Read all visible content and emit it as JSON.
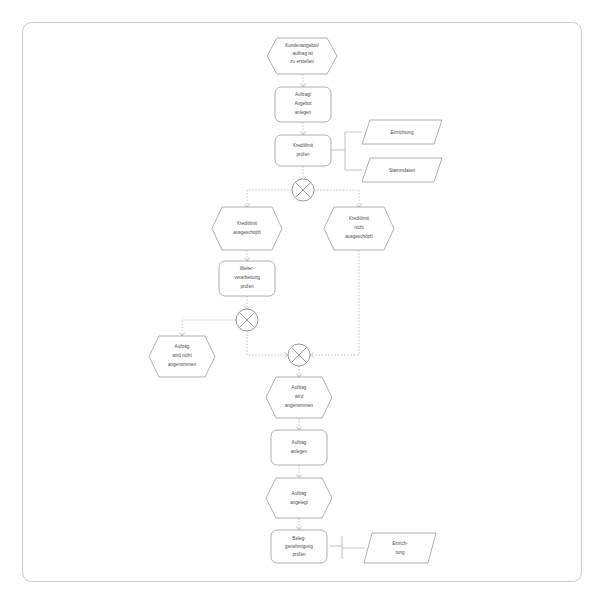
{
  "diagram": {
    "type": "event-driven-process-chain",
    "colors": {
      "shape_stroke": "#9a9a9a",
      "connector_stroke": "#8f8f8f",
      "link_stroke": "#b4b4b4",
      "frame_stroke": "#c9c9c9",
      "text": "#4a4a4a",
      "background": "#ffffff"
    },
    "nodes": [
      {
        "id": "e_start",
        "kind": "event",
        "icon": "hexagon-event",
        "lines": [
          "Kundenangebot/",
          "-auftrag ist",
          "zu erstellen"
        ]
      },
      {
        "id": "f_anlegen",
        "kind": "function",
        "icon": "rounded-rect-function",
        "lines": [
          "Auftrag/",
          "Angebot",
          "anlegen"
        ]
      },
      {
        "id": "f_kredit",
        "kind": "function",
        "icon": "rounded-rect-function",
        "lines": [
          "Kreditlimit",
          "prüfen"
        ]
      },
      {
        "id": "o_einr1",
        "kind": "organization",
        "icon": "parallelogram-unit",
        "lines": [
          "Einrichtung"
        ]
      },
      {
        "id": "o_stamm",
        "kind": "organization",
        "icon": "parallelogram-unit",
        "lines": [
          "Stammdaten"
        ]
      },
      {
        "id": "x1",
        "kind": "connector",
        "icon": "xor-connector",
        "lines": [
          "X"
        ]
      },
      {
        "id": "e_ausg",
        "kind": "event",
        "icon": "hexagon-event",
        "lines": [
          "Kreditlimit",
          "ausgeschöpft"
        ]
      },
      {
        "id": "e_nausg",
        "kind": "event",
        "icon": "hexagon-event",
        "lines": [
          "Kreditlimit",
          "nicht",
          "ausgeschöpft"
        ]
      },
      {
        "id": "f_weiter",
        "kind": "function",
        "icon": "rounded-rect-function",
        "lines": [
          "Weiter-",
          "verarbeitung",
          "prüfen"
        ]
      },
      {
        "id": "x2",
        "kind": "connector",
        "icon": "xor-connector",
        "lines": [
          "X"
        ]
      },
      {
        "id": "e_nichtang",
        "kind": "event",
        "icon": "hexagon-event",
        "lines": [
          "Auftrag",
          "wird nicht",
          "angenommen"
        ]
      },
      {
        "id": "x3",
        "kind": "connector",
        "icon": "xor-connector",
        "lines": [
          "X"
        ]
      },
      {
        "id": "e_ang",
        "kind": "event",
        "icon": "hexagon-event",
        "lines": [
          "Auftrag",
          "wird",
          "angenommen"
        ]
      },
      {
        "id": "f_auftrag",
        "kind": "function",
        "icon": "rounded-rect-function",
        "lines": [
          "Auftrag",
          "anlegen"
        ]
      },
      {
        "id": "e_angelegt",
        "kind": "event",
        "icon": "hexagon-event",
        "lines": [
          "Auftrag",
          "angelegt"
        ]
      },
      {
        "id": "f_beleg",
        "kind": "function",
        "icon": "rounded-rect-function",
        "lines": [
          "Beleg-",
          "genehmigung",
          "prüfen"
        ]
      },
      {
        "id": "o_einr2",
        "kind": "organization",
        "icon": "parallelogram-unit",
        "lines": [
          "Einrich-",
          "tung"
        ]
      }
    ]
  }
}
